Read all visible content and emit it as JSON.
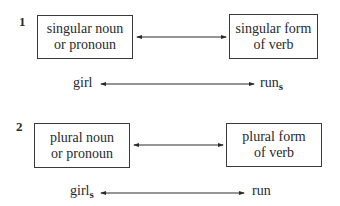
{
  "diagram": {
    "rules": [
      {
        "number": "1",
        "left_box": {
          "line1": "singular noun",
          "line2": "or pronoun"
        },
        "right_box": {
          "line1": "singular form",
          "line2": "of verb"
        },
        "example_left": {
          "base": "girl",
          "suffix": ""
        },
        "example_right": {
          "base": "run",
          "suffix": "s"
        }
      },
      {
        "number": "2",
        "left_box": {
          "line1": "plural noun",
          "line2": "or pronoun"
        },
        "right_box": {
          "line1": "plural form",
          "line2": "of verb"
        },
        "example_left": {
          "base": "girl",
          "suffix": "s"
        },
        "example_right": {
          "base": "run",
          "suffix": ""
        }
      }
    ],
    "colors": {
      "line": "#2a2a2a",
      "background": "#ffffff"
    }
  }
}
